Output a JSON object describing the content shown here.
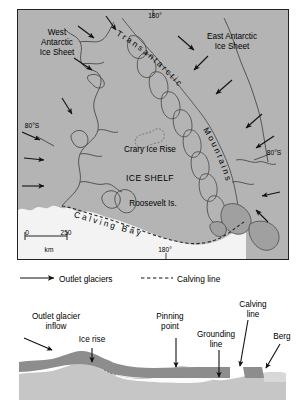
{
  "figure": {
    "type": "two-panel scientific diagram"
  },
  "panel_a": {
    "tag": "(a)",
    "labels": {
      "west_ice_sheet": "West\nAntarctic\nIce Sheet",
      "east_ice_sheet": "East Antarctic\nIce Sheet",
      "mountains_upper": "Transantarctic",
      "mountains_lower": "Mountains",
      "crary": "Crary Ice Rise",
      "ice_shelf": "ICE SHELF",
      "roosevelt": "Roosevelt Is.",
      "calving_bay": "Calving Bay"
    },
    "graticule": {
      "meridian_top": "180°",
      "meridian_bottom": "180°",
      "parallel_left": "80°S",
      "parallel_right": "80°S"
    },
    "scalebar": {
      "min": "0",
      "max": "250",
      "unit": "km"
    },
    "colors": {
      "land_ice": "#b4b4b4",
      "ocean": "#f2f2f2",
      "outline": "#3b3b3b",
      "frame": "#222222"
    }
  },
  "legend": {
    "items": [
      {
        "label": "Outlet glaciers",
        "symbol": "solid-arrow"
      },
      {
        "label": "Calving line",
        "symbol": "dashed-line"
      }
    ]
  },
  "panel_b": {
    "tag": "(b)",
    "labels": {
      "outlet_glacier_inflow": "Outlet glacier\ninflow",
      "ice_rise": "Ice rise",
      "pinning_point": "Pinning\npoint",
      "grounding_line": "Grounding\nline",
      "calving_line": "Calving\nline",
      "berg": "Berg"
    },
    "colors": {
      "ice": "#8e8e8e",
      "bedrock": "#c9c9c9",
      "water": "#fbfbfb",
      "sky": "#ffffff"
    }
  }
}
